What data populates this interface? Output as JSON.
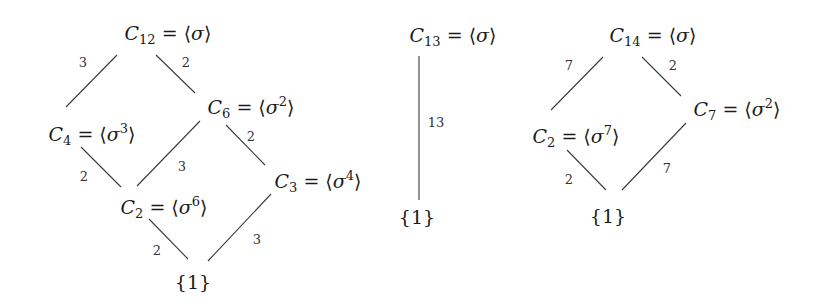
{
  "diagrams": [
    {
      "name": "subgroup-lattice-C12",
      "nodes": [
        {
          "id": "C12",
          "group": "C",
          "index": "12",
          "gen": "σ",
          "exp": "",
          "x": 168,
          "y": 35
        },
        {
          "id": "C6",
          "group": "C",
          "index": "6",
          "gen": "σ",
          "exp": "2",
          "x": 251,
          "y": 107
        },
        {
          "id": "C4",
          "group": "C",
          "index": "4",
          "gen": "σ",
          "exp": "3",
          "x": 92,
          "y": 134
        },
        {
          "id": "C3",
          "group": "C",
          "index": "3",
          "gen": "σ",
          "exp": "4",
          "x": 318,
          "y": 181
        },
        {
          "id": "C2",
          "group": "C",
          "index": "2",
          "gen": "σ",
          "exp": "6",
          "x": 164,
          "y": 207
        },
        {
          "id": "trivial",
          "text": "{1}",
          "x": 193,
          "y": 282
        }
      ],
      "edges": [
        {
          "from": "C12",
          "to": "C4",
          "label": "3",
          "x1": 117,
          "y1": 55,
          "x2": 66,
          "y2": 107,
          "lx": 83,
          "ly": 62
        },
        {
          "from": "C12",
          "to": "C6",
          "label": "2",
          "x1": 156,
          "y1": 55,
          "x2": 195,
          "y2": 93,
          "lx": 186,
          "ly": 62
        },
        {
          "from": "C6",
          "to": "C3",
          "label": "2",
          "x1": 226,
          "y1": 125,
          "x2": 265,
          "y2": 165,
          "lx": 251,
          "ly": 136
        },
        {
          "from": "C6",
          "to": "C2",
          "label": "3",
          "x1": 200,
          "y1": 121,
          "x2": 137,
          "y2": 186,
          "lx": 182,
          "ly": 166
        },
        {
          "from": "C4",
          "to": "C2",
          "label": "2",
          "x1": 81,
          "y1": 147,
          "x2": 121,
          "y2": 187,
          "lx": 84,
          "ly": 176
        },
        {
          "from": "C2",
          "to": "trivial",
          "label": "2",
          "x1": 149,
          "y1": 219,
          "x2": 188,
          "y2": 259,
          "lx": 157,
          "ly": 250
        },
        {
          "from": "C3",
          "to": "trivial",
          "label": "3",
          "x1": 271,
          "y1": 194,
          "x2": 208,
          "y2": 261,
          "lx": 257,
          "ly": 239
        }
      ]
    },
    {
      "name": "subgroup-lattice-C13",
      "nodes": [
        {
          "id": "C13",
          "group": "C",
          "index": "13",
          "gen": "σ",
          "exp": "",
          "x": 453,
          "y": 37
        },
        {
          "id": "trivial",
          "text": "{1}",
          "x": 417,
          "y": 217
        }
      ],
      "edges": [
        {
          "from": "C13",
          "to": "trivial",
          "label": "13",
          "x1": 419,
          "y1": 56,
          "x2": 419,
          "y2": 200,
          "lx": 436,
          "ly": 122
        }
      ]
    },
    {
      "name": "subgroup-lattice-C14",
      "nodes": [
        {
          "id": "C14",
          "group": "C",
          "index": "14",
          "gen": "σ",
          "exp": "",
          "x": 653,
          "y": 37
        },
        {
          "id": "C7",
          "group": "C",
          "index": "7",
          "gen": "σ",
          "exp": "2",
          "x": 737,
          "y": 109
        },
        {
          "id": "C2",
          "group": "C",
          "index": "2",
          "gen": "σ",
          "exp": "7",
          "x": 576,
          "y": 136
        },
        {
          "id": "trivial",
          "text": "{1}",
          "x": 608,
          "y": 216
        }
      ],
      "edges": [
        {
          "from": "C14",
          "to": "C2",
          "label": "7",
          "x1": 603,
          "y1": 57,
          "x2": 551,
          "y2": 110,
          "lx": 569,
          "ly": 65
        },
        {
          "from": "C14",
          "to": "C7",
          "label": "2",
          "x1": 642,
          "y1": 57,
          "x2": 681,
          "y2": 96,
          "lx": 673,
          "ly": 65
        },
        {
          "from": "C2",
          "to": "trivial",
          "label": "2",
          "x1": 567,
          "y1": 150,
          "x2": 606,
          "y2": 190,
          "lx": 569,
          "ly": 179
        },
        {
          "from": "C7",
          "to": "trivial",
          "label": "7",
          "x1": 686,
          "y1": 123,
          "x2": 622,
          "y2": 190,
          "lx": 667,
          "ly": 168
        }
      ]
    }
  ]
}
